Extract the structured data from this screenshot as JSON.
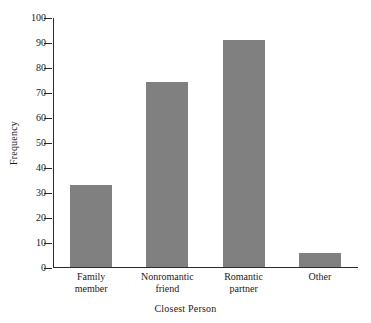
{
  "chart_data": {
    "type": "bar",
    "title": "",
    "xlabel": "Closest Person",
    "ylabel": "Frequency",
    "categories": [
      "Family member",
      "Nonromantic friend",
      "Romantic partner",
      "Other"
    ],
    "category_lines": [
      [
        "Family",
        "member"
      ],
      [
        "Nonromantic",
        "friend"
      ],
      [
        "Romantic",
        "partner"
      ],
      [
        "Other",
        ""
      ]
    ],
    "values": [
      33,
      74,
      91,
      5.5
    ],
    "ylim": [
      0,
      100
    ],
    "ytick_values": [
      0,
      10,
      20,
      30,
      40,
      50,
      60,
      70,
      80,
      90,
      100
    ],
    "ytick_labels": [
      "0",
      "10",
      "20",
      "30",
      "40",
      "50",
      "60",
      "70",
      "80",
      "90",
      "100"
    ],
    "grid": false,
    "legend": false,
    "bar_color": "#808080",
    "axis_color": "#2b2b2b",
    "background_color": "#ffffff"
  }
}
